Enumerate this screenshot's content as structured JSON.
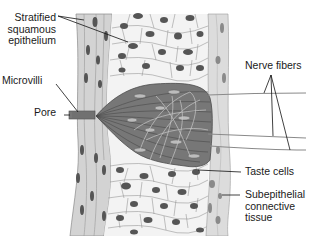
{
  "labels": {
    "epithelium": "Stratified\nsquamous\nepithelium",
    "microvilli": "Microvilli",
    "pore": "Pore",
    "nerve_fibers": "Nerve fibers",
    "taste_cells": "Taste cells",
    "connective": "Subepithelial\nconnective\ntissue"
  },
  "colors": {
    "background": "#ffffff",
    "epithelium_outer": "#d4d4d4",
    "epithelium_inner": "#f4f4f4",
    "cell_outline": "#8a8a8a",
    "nucleus": "#555555",
    "taste_bud": "#777777",
    "taste_bud_fiber": "#b5b5b5",
    "connective": "#dadada",
    "leader_line": "#111111"
  }
}
